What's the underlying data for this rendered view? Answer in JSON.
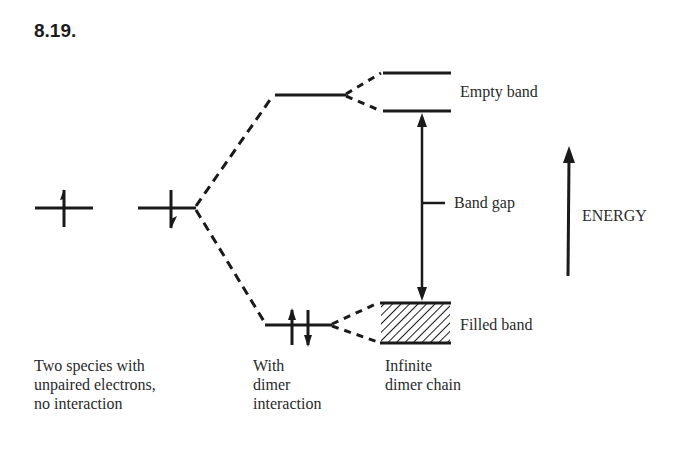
{
  "figure": {
    "number": "8.19."
  },
  "labels": {
    "empty_band": "Empty band",
    "band_gap": "Band gap",
    "energy": "ENERGY",
    "filled_band": "Filled band"
  },
  "captions": {
    "no_interaction": "Two species with\nunpaired electrons,\nno interaction",
    "dimer_interaction": "With\ndimer\ninteraction",
    "infinite_chain": "Infinite\ndimer chain"
  },
  "diagram": {
    "type": "energy-level / band formation diagram",
    "columns": [
      {
        "name": "isolated species",
        "levels": [
          {
            "y": 208,
            "electrons": [
              "up"
            ]
          },
          {
            "y": 208,
            "electrons": [
              "down"
            ]
          }
        ]
      },
      {
        "name": "dimer",
        "levels": [
          {
            "y": 95,
            "electrons": []
          },
          {
            "y": 325,
            "electrons": [
              "up",
              "down"
            ]
          }
        ]
      },
      {
        "name": "infinite dimer chain",
        "bands": [
          {
            "name": "Empty band",
            "top": 73,
            "bottom": 111,
            "filled": false
          },
          {
            "name": "Filled band",
            "top": 303,
            "bottom": 343,
            "filled": true
          }
        ]
      }
    ],
    "colors": {
      "ink": "#1a1a1a",
      "background": "#ffffff"
    }
  }
}
